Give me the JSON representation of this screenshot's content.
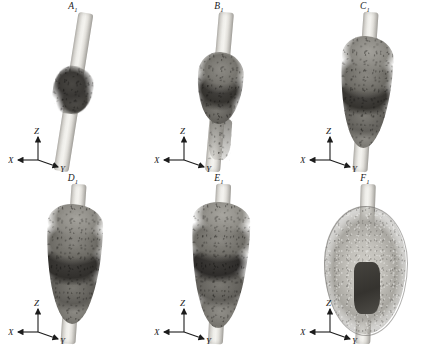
{
  "figure": {
    "background_color": "#ffffff",
    "rod_color": "#eeede9",
    "deposit_dark_color": "#3a3835",
    "deposit_light_color": "#8d8b85",
    "label_color": "#1a1a1a",
    "axis_color": "#1c1c1c"
  },
  "axis_triad": {
    "name": "coordinate-axes",
    "x_label": "X",
    "y_label": "Y",
    "z_label": "Z"
  },
  "panels": [
    {
      "id": "A1",
      "label_letter": "A",
      "label_subscript": "1",
      "row": 0,
      "column": 0,
      "specimen": "rod with small dark deposit at mid-span"
    },
    {
      "id": "B1",
      "label_letter": "B",
      "label_subscript": "1",
      "row": 0,
      "column": 1,
      "specimen": "rod with enlarged banded deposit and lower tail"
    },
    {
      "id": "C1",
      "label_letter": "C",
      "label_subscript": "1",
      "row": 0,
      "column": 2,
      "specimen": "rod with elongated multi-layer granular deposit"
    },
    {
      "id": "D1",
      "label_letter": "D",
      "label_subscript": "1",
      "row": 1,
      "column": 0,
      "specimen": "rod with further thickened granular deposit"
    },
    {
      "id": "E1",
      "label_letter": "E",
      "label_subscript": "1",
      "row": 1,
      "column": 1,
      "specimen": "rod with tall granular deposit and dark central core"
    },
    {
      "id": "F1",
      "label_letter": "F",
      "label_subscript": "1",
      "row": 1,
      "column": 2,
      "specimen": "rod enveloped by large ellipsoidal mass with dark inner core"
    }
  ]
}
